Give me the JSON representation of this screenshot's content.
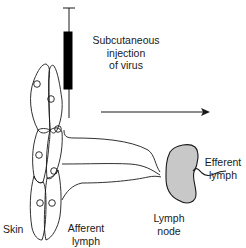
{
  "diagram": {
    "type": "anatomical-schematic",
    "labels": {
      "injection": [
        "Subcutaneous",
        "injection",
        "of virus"
      ],
      "skin": "Skin",
      "afferent": [
        "Afferent",
        "lymph"
      ],
      "lymph_node": [
        "Lymph",
        "node"
      ],
      "efferent": [
        "Efferent",
        "lymph"
      ]
    },
    "elements": {
      "syringe": "vertical needle with black barrel inserted into skin",
      "skin_cells": "elongated epithelial cells with circular nuclei",
      "afferent_vessels": 3,
      "lymph_node": "gray bean-shaped node",
      "efferent_vessel": "wavy line leaving node",
      "flow_arrow": "horizontal arrow pointing right"
    },
    "colors": {
      "line": "#1a1a1a",
      "node_fill": "#c8c8c8",
      "barrel": "#000000",
      "background": "#ffffff"
    }
  }
}
